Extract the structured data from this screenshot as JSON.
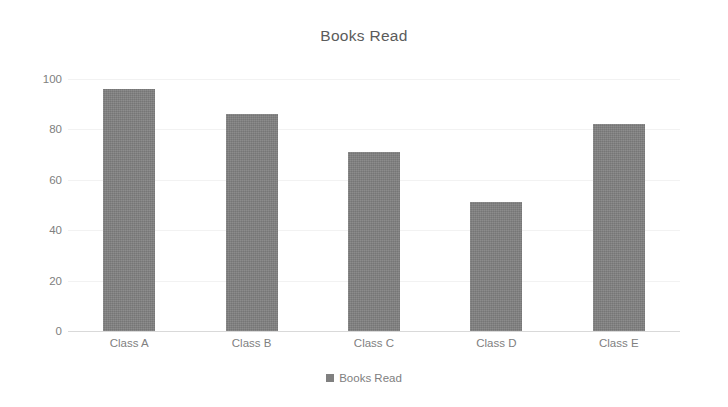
{
  "chart_data": {
    "type": "bar",
    "title": "Books Read",
    "categories": [
      "Class A",
      "Class B",
      "Class C",
      "Class D",
      "Class E"
    ],
    "values": [
      96,
      86,
      71,
      51,
      82
    ],
    "series": [
      {
        "name": "Books Read",
        "values": [
          96,
          86,
          71,
          51,
          82
        ]
      }
    ],
    "xlabel": "",
    "ylabel": "",
    "ylim": [
      0,
      100
    ],
    "yticks": [
      0,
      20,
      40,
      60,
      80,
      100
    ],
    "ytick_labels": [
      "0",
      "20",
      "40",
      "60",
      "80",
      "100"
    ],
    "grid": true,
    "legend": {
      "position": "bottom",
      "entries": [
        "Books Read"
      ]
    },
    "colors": {
      "bar": "#808080",
      "title_text": "#5b5b5b",
      "tick_text": "#808080",
      "gridline": "#f2f2f2",
      "axis_line": "#d9d9d9",
      "background": "#ffffff"
    }
  }
}
